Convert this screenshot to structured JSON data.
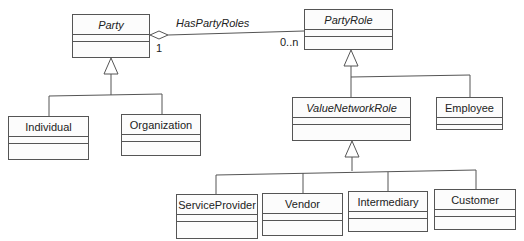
{
  "diagram": {
    "type": "uml-class-diagram",
    "classes": {
      "party": {
        "name": "Party",
        "abstract": true
      },
      "party_role": {
        "name": "PartyRole",
        "abstract": true
      },
      "individual": {
        "name": "Individual",
        "abstract": false
      },
      "organization": {
        "name": "Organization",
        "abstract": false
      },
      "value_network_role": {
        "name": "ValueNetworkRole",
        "abstract": true
      },
      "employee": {
        "name": "Employee",
        "abstract": false
      },
      "service_provider": {
        "name": "ServiceProvider",
        "abstract": false
      },
      "vendor": {
        "name": "Vendor",
        "abstract": false
      },
      "intermediary": {
        "name": "Intermediary",
        "abstract": false
      },
      "customer": {
        "name": "Customer",
        "abstract": false
      }
    },
    "associations": [
      {
        "name": "HasPartyRoles",
        "type": "aggregation",
        "from": "Party",
        "to": "PartyRole",
        "from_multiplicity": "1",
        "to_multiplicity": "0..n"
      }
    ],
    "generalizations": [
      {
        "parent": "Party",
        "children": [
          "Individual",
          "Organization"
        ]
      },
      {
        "parent": "PartyRole",
        "children": [
          "ValueNetworkRole",
          "Employee"
        ]
      },
      {
        "parent": "ValueNetworkRole",
        "children": [
          "ServiceProvider",
          "Vendor",
          "Intermediary",
          "Customer"
        ]
      }
    ],
    "labels": {
      "association_name": "HasPartyRoles",
      "multiplicity_party": "1",
      "multiplicity_role": "0..n"
    }
  }
}
